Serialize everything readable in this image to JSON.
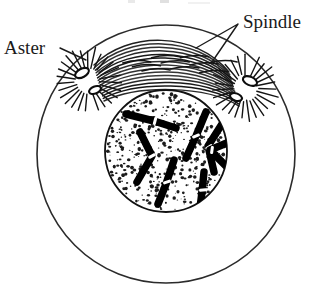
{
  "figure": {
    "background_color": "#ffffff",
    "ink_color": "#000000",
    "width": 324,
    "height": 291
  },
  "cut_caption": {
    "text": "",
    "note": "faint remnants of a cropped caption line at top of frame"
  },
  "labels": [
    {
      "id": "aster",
      "text": "Aster",
      "x": 4,
      "y": 54,
      "anchor": "start",
      "leader": "M 60,48 L 86,60",
      "target": "left aster"
    },
    {
      "id": "spindle",
      "text": "Spindle",
      "x": 243,
      "y": 28,
      "anchor": "start",
      "leader": "M 238,24 L 196,48 M 238,24 L 212,62",
      "target": "spindle fibers"
    }
  ],
  "structures": {
    "cell_membrane": {
      "name": "cell-membrane",
      "shape": "circle",
      "cx": 166,
      "cy": 154,
      "r": 129,
      "stroke_color": "#2b2b2b"
    },
    "nucleus": {
      "name": "nuclear-region",
      "shape": "circle",
      "cx": 166,
      "cy": 151,
      "r": 61,
      "fill": "#ffffff",
      "stroke_color": "#111111",
      "texture": "stippled"
    },
    "asters": [
      {
        "id": "aster-left",
        "cx": 88,
        "cy": 81,
        "ray_count": 26,
        "ray_inner": 13,
        "ray_outer": 32,
        "centrioles": [
          {
            "cx": 82,
            "cy": 73,
            "rx": 7.5,
            "ry": 4.2,
            "rotate": -28
          },
          {
            "cx": 95,
            "cy": 90,
            "rx": 6.2,
            "ry": 3.6,
            "rotate": -22
          }
        ]
      },
      {
        "id": "aster-right",
        "cx": 245,
        "cy": 88,
        "ray_count": 26,
        "ray_inner": 13,
        "ray_outer": 32,
        "centrioles": [
          {
            "cx": 250,
            "cy": 81,
            "rx": 7.5,
            "ry": 4.2,
            "rotate": 24
          },
          {
            "cx": 236,
            "cy": 97,
            "rx": 6.2,
            "ry": 3.6,
            "rotate": 20
          }
        ]
      }
    ],
    "spindle": {
      "name": "spindle-fibers",
      "fiber_count": 15,
      "description": "arcing fibers spanning between the two asters above the nucleus"
    },
    "chromosomes": [
      {
        "id": "chr-1",
        "path": "M 126,114 L 154,121 L 176,128",
        "centromere": {
          "x": 155,
          "y": 121,
          "angle": 14
        }
      },
      {
        "id": "chr-2",
        "path": "M 206,112 L 196,136 L 186,158",
        "centromere": {
          "x": 196,
          "y": 136,
          "angle": 68
        }
      },
      {
        "id": "chr-3",
        "path": "M 140,132 L 152,156 L 137,182",
        "centromere": {
          "x": 152,
          "y": 156,
          "angle": 62
        }
      },
      {
        "id": "chr-4",
        "path": "M 222,124 L 208,146 L 214,172",
        "centromere": {
          "x": 209,
          "y": 147,
          "angle": 56
        }
      },
      {
        "id": "chr-5",
        "path": "M 234,140 L 210,150 L 226,166",
        "centromere": {
          "x": 212,
          "y": 150,
          "angle": 8
        }
      },
      {
        "id": "chr-6",
        "path": "M 174,160 L 166,184 L 158,204",
        "centromere": {
          "x": 167,
          "y": 182,
          "angle": 70
        }
      },
      {
        "id": "chr-7",
        "path": "M 204,172 L 202,192 L 200,208",
        "centromere": {
          "x": 203,
          "y": 190,
          "angle": 84
        }
      }
    ]
  }
}
